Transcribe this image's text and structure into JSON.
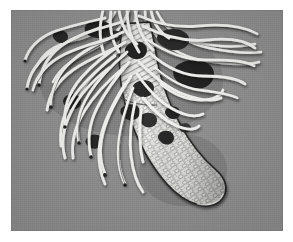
{
  "figure": {
    "caption": "",
    "medium": "halftone engraving illustration",
    "alt_text": "Black and white scientific illustration on a gray plate showing an elongated, downward-curving cylindrical body covered in a net-like pattern of oval cells, with a dense mass of long, wavy white filaments radiating upward, left and right from its upper end, and dark irregular blotches clustered along the upper stalk."
  },
  "colors": {
    "page_background": "#ffffff",
    "plate_background": "#8e8e8e",
    "filament_fill": "#f2f2f0",
    "filament_outline": "#2a2a2a",
    "body_fill": "#e9e9e6",
    "body_outline": "#232323",
    "cell_outline": "#5a5a5a",
    "blotch_dark": "#1a1a1a",
    "blotch_mid": "#3d3d3d",
    "shadow": "#5c5c5c"
  },
  "plate": {
    "x": 11,
    "y": 10,
    "width": 272,
    "height": 221,
    "margin_color": "#ffffff"
  },
  "elements": {
    "body_label": "reticulated cylindrical body",
    "tip_label": "rounded distal tip",
    "filaments_label": "radiating filaments",
    "blotches_label": "dark adhering blotches",
    "stalk_label": "banded proximal stalk"
  },
  "counts": {
    "filaments": 34,
    "blotches": 14,
    "cell_rows": 22
  }
}
